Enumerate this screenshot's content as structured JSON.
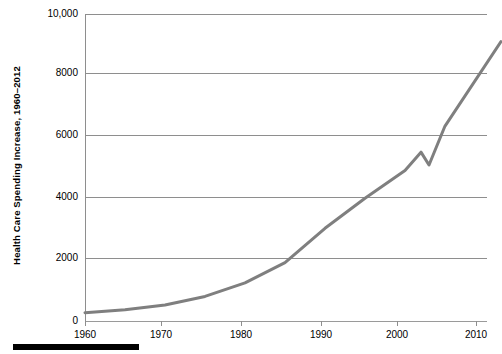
{
  "chart_data": {
    "type": "line",
    "title": "",
    "xlabel": "",
    "ylabel": "Health Care Spending Increase, 1960–2012",
    "xlim": [
      1960,
      2012
    ],
    "ylim": [
      0,
      10000
    ],
    "grid": true,
    "legend_position": "none",
    "line_color": "#7f7f7f",
    "x_ticks": [
      1960,
      1970,
      1980,
      1990,
      2000,
      2010
    ],
    "x_tick_labels": [
      "1960",
      "1970",
      "1980",
      "1990",
      "2000",
      "2010"
    ],
    "y_ticks": [
      0,
      2000,
      4000,
      6000,
      8000,
      10000
    ],
    "y_tick_labels": [
      "0",
      "2000",
      "4000",
      "6000",
      "8000",
      "10,000"
    ],
    "x": [
      1960,
      1965,
      1970,
      1975,
      1980,
      1985,
      1990,
      1995,
      2000,
      2002,
      2003,
      2005,
      2012
    ],
    "values": [
      270,
      370,
      520,
      800,
      1240,
      1900,
      3020,
      4000,
      4900,
      5500,
      5080,
      6350,
      9100
    ],
    "series": [
      {
        "name": "Health Care Spending Increase",
        "values": [
          270,
          370,
          520,
          800,
          1240,
          1900,
          3020,
          4000,
          4900,
          5500,
          5080,
          6350,
          9100
        ]
      }
    ],
    "annotations": []
  },
  "axis": {
    "y_title": "Health Care Spending Increase, 1960–2012",
    "y_labels": [
      "10,000",
      "8000",
      "6000",
      "4000",
      "2000",
      "0"
    ],
    "x_labels": [
      "1960",
      "1970",
      "1980",
      "1990",
      "2000",
      "2010"
    ]
  },
  "colors": {
    "line": "#7f7f7f",
    "grid": "#8e8e8e",
    "text": "#000000",
    "rule": "#000000",
    "background": "#ffffff"
  }
}
